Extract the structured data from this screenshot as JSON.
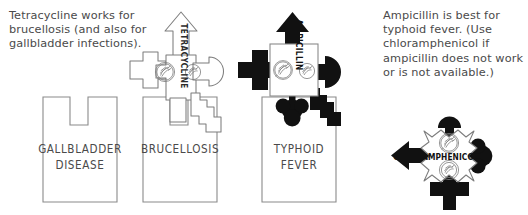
{
  "captions": {
    "left": "Tetracycline works for brucellosis (and also for gallbladder infections).",
    "right": "Ampicillin is best for typhoid fever. (Use chloramphenicol if ampicillin does not work or is not available.)"
  },
  "disease_boxes": [
    {
      "id": "gallbladder",
      "line1": "GALLBLADDER",
      "line2": "DISEASE",
      "lock_type": "square-notch"
    },
    {
      "id": "brucellosis",
      "line1": "BRUCELLOSIS",
      "line2": "",
      "lock_type": "square-notch"
    },
    {
      "id": "typhoid",
      "line1": "TYPHOID",
      "line2": "FEVER",
      "lock_type": "keyhole-notch"
    }
  ],
  "drug_keys": [
    {
      "id": "tetracycline",
      "label": "TETRACYCLINE",
      "orientation": "vertical",
      "style": "outline"
    },
    {
      "id": "ampicillin",
      "label": "AMPICILLIN",
      "orientation": "vertical",
      "style": "solid"
    },
    {
      "id": "chloramphenicol",
      "label": "CHLORAMPHENICOL",
      "orientation": "horizontal",
      "style": "solid"
    }
  ],
  "standalone_marks": [
    {
      "id": "plus-between-boxes",
      "shape": "cross",
      "color": "#111111"
    }
  ],
  "colors": {
    "ink": "#111111",
    "outline": "#7d7d7d",
    "text": "#4a4a4a",
    "paper": "#ffffff"
  }
}
